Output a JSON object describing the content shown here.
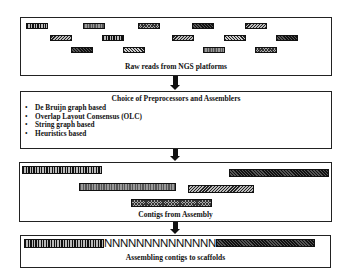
{
  "diagram": {
    "type": "flowchart",
    "direction": "top-to-bottom",
    "steps": [
      {
        "id": "raw-reads",
        "caption": "Raw reads from NGS platforms",
        "reads": [
          {
            "row": 1,
            "x": 25,
            "w": 22,
            "pattern": "vertical"
          },
          {
            "row": 1,
            "x": 82,
            "w": 22,
            "pattern": "vertical-grey"
          },
          {
            "row": 1,
            "x": 137,
            "w": 22,
            "pattern": "cross"
          },
          {
            "row": 1,
            "x": 191,
            "w": 22,
            "pattern": "dark"
          },
          {
            "row": 1,
            "x": 244,
            "w": 22,
            "pattern": "diagonal2"
          },
          {
            "row": 2,
            "x": 49,
            "w": 22,
            "pattern": "diagonal2"
          },
          {
            "row": 2,
            "x": 101,
            "w": 22,
            "pattern": "vertical"
          },
          {
            "row": 2,
            "x": 171,
            "w": 22,
            "pattern": "diagonal2"
          },
          {
            "row": 2,
            "x": 223,
            "w": 22,
            "pattern": "diagonal"
          },
          {
            "row": 2,
            "x": 275,
            "w": 22,
            "pattern": "dark"
          },
          {
            "row": 3,
            "x": 70,
            "w": 22,
            "pattern": "dark"
          },
          {
            "row": 3,
            "x": 122,
            "w": 22,
            "pattern": "diagonal"
          },
          {
            "row": 3,
            "x": 202,
            "w": 22,
            "pattern": "vertical-grey"
          },
          {
            "row": 3,
            "x": 254,
            "w": 22,
            "pattern": "cross"
          }
        ]
      },
      {
        "id": "choice",
        "title": "Choice of Preprocessors and Assemblers",
        "bullet": "•",
        "items": [
          "De Bruijn graph based",
          "Overlap Layout Consensus (OLC)",
          "String graph based",
          "Heuristics based"
        ]
      },
      {
        "id": "contigs",
        "caption": "Contigs from Assembly",
        "contigs": [
          {
            "x": 22,
            "y": 166,
            "w": 80,
            "pattern": "vertical"
          },
          {
            "x": 229,
            "y": 169,
            "w": 100,
            "pattern": "dark"
          },
          {
            "x": 79,
            "y": 183,
            "w": 97,
            "pattern": "vertical-grey"
          },
          {
            "x": 188,
            "y": 185,
            "w": 66,
            "pattern": "diagonal2"
          },
          {
            "x": 131,
            "y": 199,
            "w": 81,
            "pattern": "cross"
          }
        ]
      },
      {
        "id": "scaffolds",
        "caption": "Assembling contigs to scaffolds",
        "gap_text": "NNNNNNNNNNNNNN",
        "left_contig": {
          "pattern": "vertical"
        },
        "right_contig": {
          "pattern": "dark"
        }
      }
    ]
  }
}
